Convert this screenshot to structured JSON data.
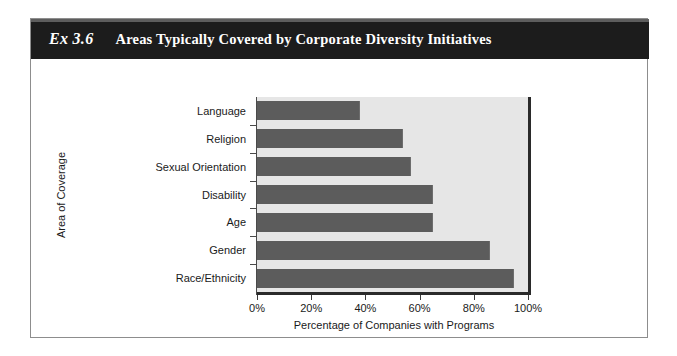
{
  "figure": {
    "exhibit_number": "Ex 3.6",
    "title": "Areas Typically Covered by Corporate Diversity Initiatives"
  },
  "colors": {
    "header_background": "#1c1c1c",
    "header_text": "#ffffff",
    "bar_fill": "#5c5c5c",
    "plot_background": "#e6e6e6",
    "axis_line": "#2a2a2a",
    "frame_border": "#8d8d8d"
  },
  "chart_data": {
    "type": "bar",
    "orientation": "horizontal",
    "title": "Areas Typically Covered by Corporate Diversity Initiatives",
    "xlabel": "Percentage of Companies with Programs",
    "ylabel": "Area of Coverage",
    "categories": [
      "Language",
      "Religion",
      "Sexual Orientation",
      "Disability",
      "Age",
      "Gender",
      "Race/Ethnicity"
    ],
    "values": [
      38,
      54,
      57,
      65,
      65,
      86,
      95
    ],
    "xlim": [
      0,
      100
    ],
    "xticks": [
      0,
      20,
      40,
      60,
      80,
      100
    ],
    "xtick_labels": [
      "0%",
      "20%",
      "40%",
      "60%",
      "80%",
      "100%"
    ],
    "grid": false,
    "legend": null
  }
}
